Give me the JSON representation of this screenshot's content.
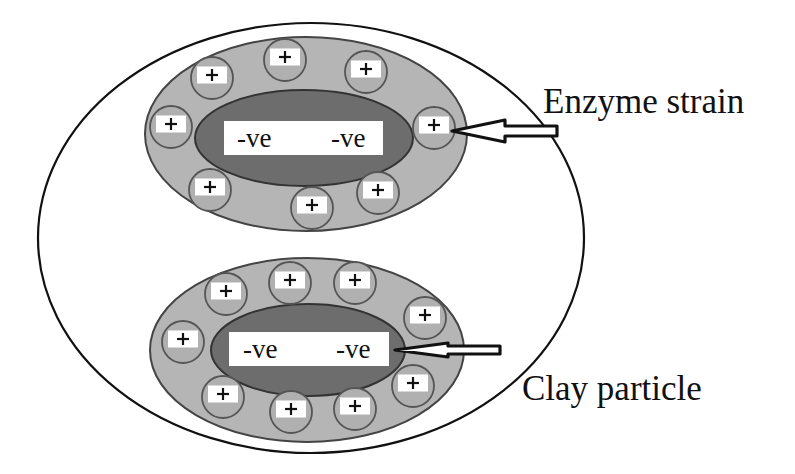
{
  "diagram": {
    "colors": {
      "background": "#ffffff",
      "outline": "#111111",
      "shell_fill": "#b5b5b5",
      "shell_stroke": "#444444",
      "core_fill": "#6d6d6d",
      "core_stroke": "#333333",
      "cation_fill": "#b0b0b0",
      "cation_stroke": "#555555",
      "label_box_fill": "#ffffff"
    },
    "boundary": {
      "cx": 311,
      "cy": 238,
      "rx": 273,
      "ry": 215
    },
    "groups": [
      {
        "id": "top",
        "shell": {
          "cx": 306,
          "cy": 134,
          "rx": 161,
          "ry": 97
        },
        "core": {
          "cx": 304,
          "cy": 138,
          "rx": 109,
          "ry": 48
        },
        "charge_box": {
          "x": 224,
          "y": 121,
          "w": 159,
          "h": 34
        },
        "charges": [
          {
            "text": "-ve",
            "x": 237,
            "y": 147
          },
          {
            "text": "-ve",
            "x": 331,
            "y": 147
          }
        ],
        "cations": [
          {
            "cx": 212,
            "cy": 78
          },
          {
            "cx": 285,
            "cy": 60
          },
          {
            "cx": 366,
            "cy": 72
          },
          {
            "cx": 171,
            "cy": 127
          },
          {
            "cx": 434,
            "cy": 128
          },
          {
            "cx": 210,
            "cy": 190
          },
          {
            "cx": 312,
            "cy": 208
          },
          {
            "cx": 378,
            "cy": 193
          }
        ]
      },
      {
        "id": "bottom",
        "shell": {
          "cx": 307,
          "cy": 350,
          "rx": 157,
          "ry": 92
        },
        "core": {
          "cx": 308,
          "cy": 350,
          "rx": 97,
          "ry": 46
        },
        "charge_box": {
          "x": 229,
          "y": 332,
          "w": 160,
          "h": 34
        },
        "charges": [
          {
            "text": "-ve",
            "x": 243,
            "y": 358
          },
          {
            "text": "-ve",
            "x": 336,
            "y": 358
          }
        ],
        "cations": [
          {
            "cx": 226,
            "cy": 294
          },
          {
            "cx": 290,
            "cy": 283
          },
          {
            "cx": 355,
            "cy": 283
          },
          {
            "cx": 425,
            "cy": 318
          },
          {
            "cx": 183,
            "cy": 342
          },
          {
            "cx": 223,
            "cy": 397
          },
          {
            "cx": 291,
            "cy": 412
          },
          {
            "cx": 355,
            "cy": 409
          },
          {
            "cx": 413,
            "cy": 386
          }
        ]
      }
    ],
    "cation_symbol": "+",
    "cation_radius": 21,
    "annotations": [
      {
        "id": "enzyme-strain",
        "text": "Enzyme strain",
        "text_x": 543,
        "text_y": 113,
        "font_size": 35,
        "arrow": {
          "tip_x": 452,
          "tip_y": 131,
          "head_x": 505,
          "head_half": 11,
          "shaft_end_x": 557,
          "shaft_half": 5
        }
      },
      {
        "id": "clay-particle",
        "text": "Clay particle",
        "text_x": 522,
        "text_y": 400,
        "font_size": 35,
        "arrow": {
          "tip_x": 395,
          "tip_y": 350,
          "head_x": 448,
          "head_half": 7,
          "shaft_end_x": 500,
          "shaft_half": 4
        }
      }
    ]
  }
}
